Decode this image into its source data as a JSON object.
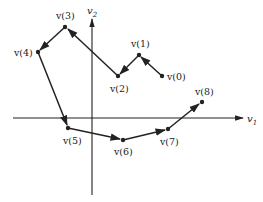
{
  "diagram": {
    "type": "vector-trajectory",
    "axes": {
      "horizontal": {
        "label": "v",
        "subscript": "1"
      },
      "vertical": {
        "label": "v",
        "subscript": "2"
      }
    },
    "points": [
      {
        "id": "v0",
        "label": "v(0)",
        "x": 162,
        "y": 76
      },
      {
        "id": "v1",
        "label": "v(1)",
        "x": 139,
        "y": 55
      },
      {
        "id": "v2",
        "label": "v(2)",
        "x": 118,
        "y": 76
      },
      {
        "id": "v3",
        "label": "v(3)",
        "x": 65,
        "y": 27
      },
      {
        "id": "v4",
        "label": "v(4)",
        "x": 38,
        "y": 52
      },
      {
        "id": "v5",
        "label": "v(5)",
        "x": 68,
        "y": 128
      },
      {
        "id": "v6",
        "label": "v(6)",
        "x": 123,
        "y": 140
      },
      {
        "id": "v7",
        "label": "v(7)",
        "x": 168,
        "y": 129
      },
      {
        "id": "v8",
        "label": "v(8)",
        "x": 202,
        "y": 102
      }
    ],
    "sequence_order": [
      "v(0)",
      "v(1)",
      "v(2)",
      "v(3)",
      "v(4)",
      "v(5)",
      "v(6)",
      "v(7)",
      "v(8)"
    ],
    "colors": {
      "line": "#222222",
      "background": "#ffffff"
    }
  }
}
